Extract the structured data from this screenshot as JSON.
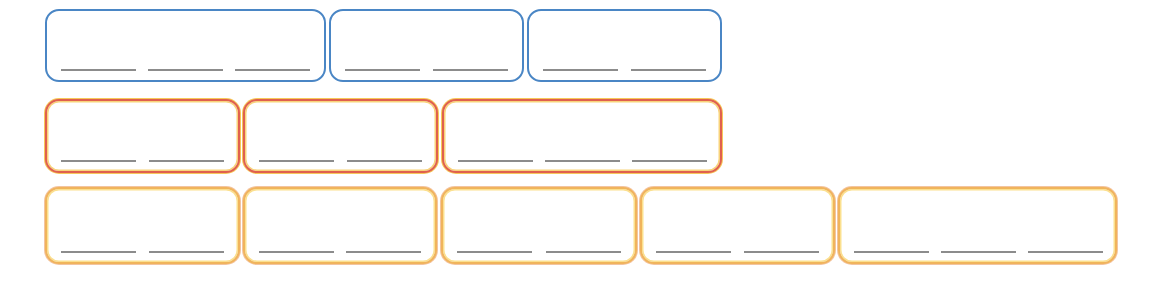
{
  "colors": {
    "blue": "#4a86c5",
    "red": "#e0604e",
    "orange": "#f0b45c",
    "blank_line": "#8c8c8c",
    "background": "#ffffff"
  },
  "rows": [
    {
      "name": "blue-row",
      "color": "blue",
      "boxes": [
        {
          "blanks": [
            "",
            "",
            ""
          ]
        },
        {
          "blanks": [
            "",
            ""
          ]
        },
        {
          "blanks": [
            "",
            ""
          ]
        }
      ]
    },
    {
      "name": "red-row",
      "color": "red",
      "boxes": [
        {
          "blanks": [
            "",
            ""
          ]
        },
        {
          "blanks": [
            "",
            ""
          ]
        },
        {
          "blanks": [
            "",
            "",
            ""
          ]
        }
      ]
    },
    {
      "name": "orange-row",
      "color": "orange",
      "boxes": [
        {
          "blanks": [
            "",
            ""
          ]
        },
        {
          "blanks": [
            "",
            ""
          ]
        },
        {
          "blanks": [
            "",
            ""
          ]
        },
        {
          "blanks": [
            "",
            ""
          ]
        },
        {
          "blanks": [
            "",
            "",
            ""
          ]
        }
      ]
    }
  ]
}
